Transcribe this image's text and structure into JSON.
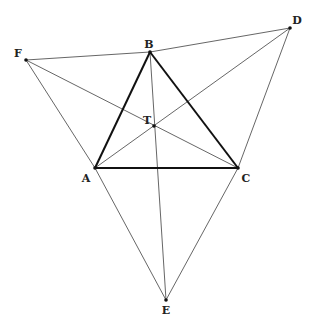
{
  "points": {
    "A": {
      "label": "A",
      "x": 95,
      "y": 168,
      "lx": 86,
      "ly": 178
    },
    "B": {
      "label": "B",
      "x": 150,
      "y": 52,
      "lx": 149,
      "ly": 44
    },
    "C": {
      "label": "C",
      "x": 238,
      "y": 168,
      "lx": 246,
      "ly": 178
    },
    "D": {
      "label": "D",
      "x": 290,
      "y": 28,
      "lx": 297,
      "ly": 20
    },
    "E": {
      "label": "E",
      "x": 166,
      "y": 300,
      "lx": 166,
      "ly": 310
    },
    "F": {
      "label": "F",
      "x": 26,
      "y": 60,
      "lx": 18,
      "ly": 53
    },
    "T": {
      "label": "T",
      "x": 154,
      "y": 126,
      "lx": 147,
      "ly": 120
    }
  },
  "thick_segments": [
    [
      "A",
      "B"
    ],
    [
      "B",
      "C"
    ],
    [
      "A",
      "C"
    ]
  ],
  "thin_segments": [
    [
      "F",
      "B"
    ],
    [
      "B",
      "D"
    ],
    [
      "F",
      "A"
    ],
    [
      "A",
      "E"
    ],
    [
      "F",
      "C"
    ],
    [
      "D",
      "A"
    ],
    [
      "D",
      "C"
    ],
    [
      "C",
      "E"
    ],
    [
      "B",
      "E"
    ]
  ],
  "colors": {
    "thick": "#111111",
    "thin": "#555555",
    "point": "#111111"
  }
}
